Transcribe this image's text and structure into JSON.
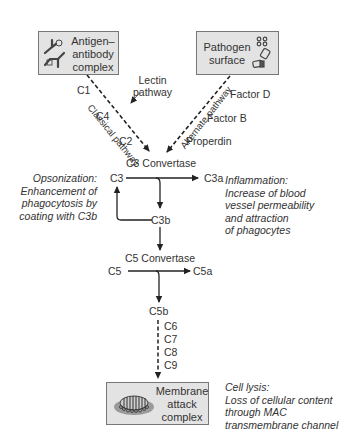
{
  "sources": {
    "antigen_antibody": {
      "line1": "Antigen–",
      "line2": "antibody",
      "line3": "complex",
      "icon": "antibody-icon"
    },
    "pathogen": {
      "line1": "Pathogen",
      "line2": "surface",
      "icon": "pathogen-icon"
    }
  },
  "pathways": {
    "classical": {
      "label": "Classical pathway",
      "components": [
        "C1",
        "C4",
        "C2"
      ]
    },
    "lectin": {
      "line1": "Lectin",
      "line2": "pathway"
    },
    "alternate": {
      "label": "Alternate pathway",
      "components": [
        "Factor D",
        "Factor B",
        "Properdin"
      ]
    }
  },
  "c3": {
    "convertase": "C3 Convertase",
    "substrate": "C3",
    "product_a": "C3a",
    "product_b": "C3b"
  },
  "c5": {
    "convertase": "C5 Convertase",
    "substrate": "C5",
    "product_a": "C5a",
    "product_b": "C5b"
  },
  "late_components": [
    "C6",
    "C7",
    "C8",
    "C9"
  ],
  "mac": {
    "line1": "Membrane",
    "line2": "attack",
    "line3": "complex",
    "icon": "membrane-pore-icon"
  },
  "effects": {
    "opsonization": [
      "Opsonization:",
      "Enhancement of",
      "phagocytosis by",
      "coating with C3b"
    ],
    "inflammation": [
      "Inflammation:",
      "Increase of blood",
      "vessel permeability",
      "and attraction",
      "of phagocytes"
    ],
    "cell_lysis": [
      "Cell lysis:",
      "Loss of cellular content",
      "through MAC",
      "transmembrane channel"
    ]
  },
  "colors": {
    "box_fill": "#e3e3e3",
    "box_border": "#777777",
    "line": "#222222",
    "text": "#333333"
  }
}
